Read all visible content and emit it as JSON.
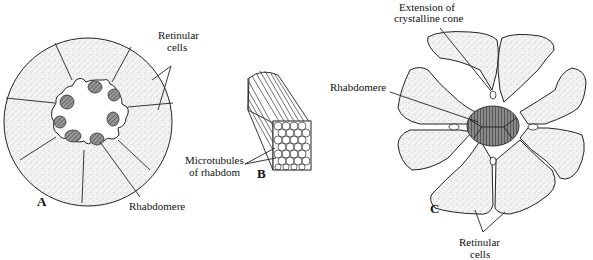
{
  "figure": {
    "panels": [
      {
        "id": "A",
        "label": "A",
        "description": "Cross section of ommatidium with separate rhabdomeres arranged around central lumen",
        "annotations": {
          "retinular_cells_line1": "Retinular",
          "retinular_cells_line2": "cells",
          "rhabdomere": "Rhabdomere"
        },
        "rhabdomere_count": 7,
        "cell_count": 8
      },
      {
        "id": "B",
        "label": "B",
        "description": "Block of microvilli (microtubules) forming the rhabdom",
        "annotations": {
          "microtubules_line1": "Microtubules",
          "microtubules_line2": "of rhabdom"
        }
      },
      {
        "id": "C",
        "label": "C",
        "description": "Cross section of ommatidium with fused central rhabdom",
        "annotations": {
          "extension_line1": "Extension of",
          "extension_line2": "crystalline cone",
          "rhabdomere": "Rhabdomere",
          "retinular_cells_line1": "Retinular",
          "retinular_cells_line2": "cells"
        },
        "cell_count": 8
      }
    ]
  }
}
